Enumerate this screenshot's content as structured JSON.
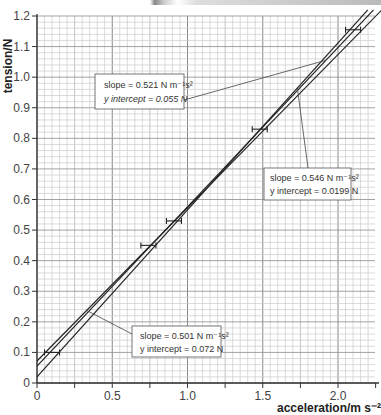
{
  "chart_data": {
    "type": "line",
    "title": "",
    "xlabel": "acceleration/m s⁻²",
    "ylabel": "tension/N",
    "xlim": [
      0,
      2.25
    ],
    "ylim": [
      0,
      1.2
    ],
    "x_ticks": [
      "0",
      "0.5",
      "1.0",
      "1.5",
      "2.0"
    ],
    "x_tick_values": [
      0,
      0.5,
      1.0,
      1.5,
      2.0
    ],
    "y_ticks": [
      "0",
      "0.1",
      "0.2",
      "0.3",
      "0.4",
      "0.5",
      "0.6",
      "0.7",
      "0.8",
      "0.9",
      "1.0",
      "1.1",
      "1.2"
    ],
    "y_tick_values": [
      0,
      0.1,
      0.2,
      0.3,
      0.4,
      0.5,
      0.6,
      0.7,
      0.8,
      0.9,
      1.0,
      1.1,
      1.2
    ],
    "grid": true,
    "points": [
      {
        "x": 0.1,
        "y": 0.1,
        "xerr": 0.05
      },
      {
        "x": 0.74,
        "y": 0.45,
        "xerr": 0.05
      },
      {
        "x": 0.91,
        "y": 0.53,
        "xerr": 0.05
      },
      {
        "x": 1.48,
        "y": 0.83,
        "xerr": 0.05
      },
      {
        "x": 2.1,
        "y": 1.155,
        "xerr": 0.05
      }
    ],
    "series": [
      {
        "name": "line-0.521",
        "slope": 0.521,
        "intercept": 0.055
      },
      {
        "name": "line-0.546",
        "slope": 0.546,
        "intercept": 0.0199
      },
      {
        "name": "line-0.501",
        "slope": 0.501,
        "intercept": 0.072
      }
    ],
    "annotations": [
      {
        "line1": "slope = 0.521 N m⁻¹s²",
        "line2": "y intercept = 0.055 N",
        "series": 0
      },
      {
        "line1": "slope = 0.546 N m⁻¹s²",
        "line2": "y intercept = 0.0199 N",
        "series": 1
      },
      {
        "line1": "slope = 0.501 N m⁻¹s²",
        "line2": "y intercept = 0.072 N",
        "series": 2
      }
    ]
  }
}
